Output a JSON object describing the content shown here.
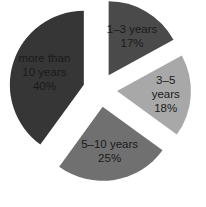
{
  "chart_data": {
    "type": "pie",
    "title": "",
    "exploded": true,
    "start_angle_deg": 0,
    "direction": "clockwise",
    "categories": [
      "1–3 years",
      "3–5 years",
      "5–10 years",
      "more than 10 years"
    ],
    "values": [
      17,
      18,
      25,
      40
    ],
    "unit": "%",
    "slices": [
      {
        "label": "1–3 years",
        "value": 17,
        "percent_label": "17%",
        "color": "#4a4a4a",
        "label_lines": [
          "1–3 years",
          "17%"
        ]
      },
      {
        "label": "3–5 years",
        "value": 18,
        "percent_label": "18%",
        "color": "#a8a8a8",
        "label_lines": [
          "3–5",
          "years",
          "18%"
        ]
      },
      {
        "label": "5–10 years",
        "value": 25,
        "percent_label": "25%",
        "color": "#707070",
        "label_lines": [
          "5–10 years",
          "25%"
        ]
      },
      {
        "label": "more than 10 years",
        "value": 40,
        "percent_label": "40%",
        "color": "#363636",
        "label_lines": [
          "more than",
          "10 years",
          "40%"
        ]
      }
    ],
    "legend": "none",
    "data_labels": "inside"
  },
  "layout": {
    "center": [
      100,
      90
    ],
    "radius": 74,
    "explode_offsets": [
      17,
      17,
      17,
      17
    ],
    "label_radius_factor": [
      0.62,
      0.66,
      0.6,
      0.56
    ]
  }
}
